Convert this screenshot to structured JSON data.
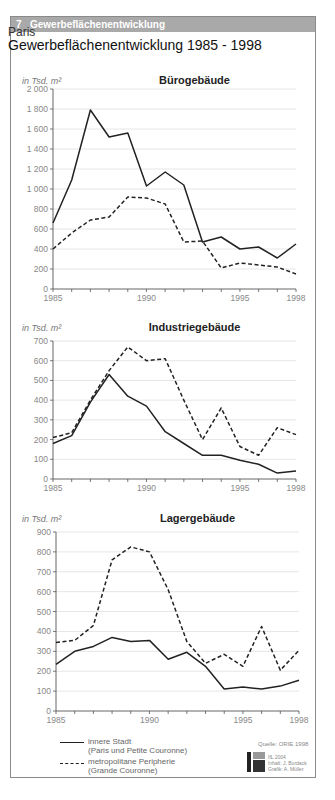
{
  "header": {
    "number": "7",
    "label": "Gewerbeflächenentwicklung"
  },
  "city": "Paris",
  "title": "Gewerbeflächenentwicklung 1985 - 1998",
  "unit_label": "in Tsd. m²",
  "legend": {
    "solid": {
      "line1": "innere Stadt",
      "line2": "(Paris und Petite Couronne)"
    },
    "dashed": {
      "line1": "metropolitane Peripherie",
      "line2": "(Grande Couronne)"
    }
  },
  "source": "Quelle: ORIE 1998",
  "credits": {
    "line1": "IfL 2004",
    "line2": "Inhalt: J. Burdack",
    "line3": "Grafik: A. Müller"
  },
  "colors": {
    "header_bg": "#a9a9a9",
    "line": "#222222",
    "grid": "#e6e6e6",
    "axis": "#555555"
  },
  "chart_data": [
    {
      "type": "line",
      "title": "Bürogebäude",
      "ylabel": "in Tsd. m²",
      "x": [
        1985,
        1986,
        1987,
        1988,
        1989,
        1990,
        1991,
        1992,
        1993,
        1994,
        1995,
        1996,
        1997,
        1998
      ],
      "xticks": [
        1985,
        1990,
        1995,
        1998
      ],
      "yticks": [
        0,
        200,
        400,
        600,
        800,
        1000,
        1200,
        1400,
        1600,
        1800,
        2000
      ],
      "ylim": [
        0,
        2000
      ],
      "grid": true,
      "series": [
        {
          "name": "innere Stadt (Paris und Petite Couronne)",
          "style": "solid",
          "values": [
            660,
            1090,
            1790,
            1520,
            1560,
            1030,
            1170,
            1040,
            470,
            520,
            400,
            420,
            310,
            450
          ]
        },
        {
          "name": "metropolitane Peripherie (Grande Couronne)",
          "style": "dashed",
          "values": [
            400,
            560,
            690,
            720,
            920,
            910,
            850,
            470,
            480,
            210,
            260,
            240,
            220,
            150
          ]
        }
      ]
    },
    {
      "type": "line",
      "title": "Industriegebäude",
      "ylabel": "in Tsd. m²",
      "x": [
        1985,
        1986,
        1987,
        1988,
        1989,
        1990,
        1991,
        1992,
        1993,
        1994,
        1995,
        1996,
        1997,
        1998
      ],
      "xticks": [
        1985,
        1990,
        1995,
        1998
      ],
      "yticks": [
        0,
        100,
        200,
        300,
        400,
        500,
        600,
        700
      ],
      "ylim": [
        0,
        700
      ],
      "grid": true,
      "series": [
        {
          "name": "innere Stadt (Paris und Petite Couronne)",
          "style": "solid",
          "values": [
            180,
            220,
            390,
            530,
            420,
            370,
            240,
            180,
            120,
            120,
            95,
            75,
            30,
            40
          ]
        },
        {
          "name": "metropolitane Peripherie (Grande Couronne)",
          "style": "dashed",
          "values": [
            210,
            235,
            400,
            550,
            670,
            600,
            610,
            400,
            200,
            360,
            165,
            120,
            260,
            225
          ]
        }
      ]
    },
    {
      "type": "line",
      "title": "Lagergebäude",
      "ylabel": "in Tsd. m²",
      "x": [
        1985,
        1986,
        1987,
        1988,
        1989,
        1990,
        1991,
        1992,
        1993,
        1994,
        1995,
        1996,
        1997,
        1998
      ],
      "xticks": [
        1985,
        1990,
        1995,
        1998
      ],
      "yticks": [
        0,
        100,
        200,
        300,
        400,
        500,
        600,
        700,
        800,
        900
      ],
      "ylim": [
        0,
        900
      ],
      "grid": true,
      "series": [
        {
          "name": "innere Stadt (Paris und Petite Couronne)",
          "style": "solid",
          "values": [
            235,
            300,
            325,
            370,
            350,
            355,
            260,
            295,
            225,
            110,
            120,
            110,
            125,
            155
          ]
        },
        {
          "name": "metropolitane Peripherie (Grande Couronne)",
          "style": "dashed",
          "values": [
            345,
            355,
            430,
            760,
            825,
            800,
            610,
            350,
            240,
            285,
            225,
            425,
            205,
            305
          ]
        }
      ]
    }
  ]
}
